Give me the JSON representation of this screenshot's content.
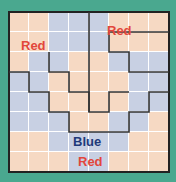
{
  "puzzle": {
    "rows": 8,
    "cols": 8,
    "colors": {
      "peach": "#f6d9c3",
      "blue": "#c8d0e3",
      "background": "#4aa88f",
      "red_text": "#e2463b",
      "blue_text": "#1f3a7a"
    },
    "grid": [
      "PPBBBPPP",
      "PPBBBPPP",
      "PBBPPBBB",
      "BBPPPPBB",
      "BBPPPPBB",
      "BBBPPBBP",
      "PPBBBBPP",
      "PPPBBPPP"
    ],
    "labels": [
      {
        "text": "Red",
        "color": "red",
        "x": 12,
        "y": 27
      },
      {
        "text": "Red",
        "color": "red",
        "x": 98,
        "y": 12
      },
      {
        "text": "Blue",
        "color": "blue",
        "x": 64,
        "y": 123
      },
      {
        "text": "Red",
        "color": "red",
        "x": 69,
        "y": 143
      }
    ]
  }
}
